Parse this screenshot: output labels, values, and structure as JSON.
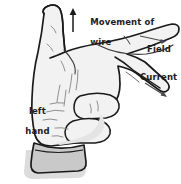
{
  "figure": {
    "subject": "left hand",
    "background_color": "#ffffff",
    "outline_color": "#1a1a1a",
    "skin_fill_color": "#f2f2f2",
    "skin_shade_color": "#e4e4e4",
    "cuff_fill_color": "#c9c9c9",
    "shadow_color": "#d8d8d8",
    "label_color": "#1c1c1c"
  },
  "labels": {
    "movement": {
      "text": "Movement of\nwire",
      "line1": "Movement of",
      "line2": "wire",
      "arrow": "up-arrow",
      "direction": "up"
    },
    "field": {
      "text": "Field",
      "arrow": "right-arrow",
      "direction": "right"
    },
    "current": {
      "text": "Current",
      "arrow": "diagonal-down-right-arrow",
      "direction": "down-right"
    },
    "hand": {
      "text": "left\nhand",
      "line1": "left",
      "line2": "hand"
    }
  },
  "mapping": [
    {
      "digit": "thumb",
      "quantity": "Movement of wire",
      "points": "up"
    },
    {
      "digit": "first finger",
      "quantity": "Field",
      "points": "right"
    },
    {
      "digit": "second finger",
      "quantity": "Current",
      "points": "down-right"
    }
  ]
}
